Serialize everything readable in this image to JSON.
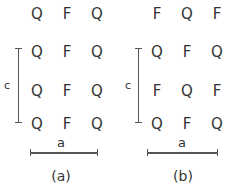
{
  "figure": {
    "type": "crystal-lattice-schematic",
    "background_color": "#ffffff",
    "text_color": "#333333",
    "rule_color": "#555555"
  },
  "panels": [
    {
      "id": "a",
      "caption": "(a)",
      "rows": [
        {
          "sites": [
            "Q",
            "F",
            "Q"
          ]
        },
        {
          "sites": [
            "Q",
            "F",
            "Q"
          ]
        },
        {
          "sites": [
            "Q",
            "F",
            "Q"
          ]
        },
        {
          "sites": [
            "Q",
            "F",
            "Q"
          ]
        }
      ],
      "dimensions": {
        "vertical_label": "c",
        "horizontal_label": "a"
      }
    },
    {
      "id": "b",
      "caption": "(b)",
      "rows": [
        {
          "sites": [
            "F",
            "Q",
            "F"
          ]
        },
        {
          "sites": [
            "Q",
            "F",
            "Q"
          ]
        },
        {
          "sites": [
            "F",
            "Q",
            "F"
          ]
        },
        {
          "sites": [
            "Q",
            "F",
            "Q"
          ]
        }
      ],
      "dimensions": {
        "vertical_label": "c",
        "horizontal_label": "a"
      }
    }
  ]
}
